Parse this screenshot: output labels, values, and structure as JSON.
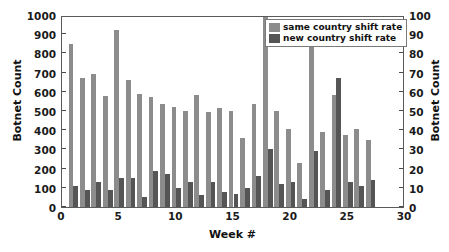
{
  "chart_data": {
    "type": "bar",
    "title": "",
    "xlabel": "Week #",
    "ylabel": "Botnet Count",
    "ylabel_right": "Botnet Count",
    "xlim": [
      0,
      30
    ],
    "ylim": [
      0,
      1000
    ],
    "ylim_right": [
      0,
      100
    ],
    "grid": false,
    "legend_position": "top-right",
    "x_ticks": [
      0,
      5,
      10,
      15,
      20,
      25,
      30
    ],
    "y_ticks_left": [
      0,
      100,
      200,
      300,
      400,
      500,
      600,
      700,
      800,
      900,
      1000
    ],
    "y_ticks_right": [
      0,
      10,
      20,
      30,
      40,
      50,
      60,
      70,
      80,
      90,
      100
    ],
    "categories": [
      1,
      2,
      3,
      4,
      5,
      6,
      7,
      8,
      9,
      10,
      11,
      12,
      13,
      14,
      15,
      16,
      17,
      18,
      19,
      20,
      21,
      22,
      23,
      24,
      25,
      26,
      27,
      28
    ],
    "series": [
      {
        "name": "same country shift rate",
        "axis": "left",
        "color": "#8c8c8c",
        "values": [
          848,
          673,
          692,
          577,
          922,
          660,
          590,
          575,
          535,
          520,
          500,
          586,
          494,
          514,
          500,
          362,
          536,
          1000,
          501,
          407,
          230,
          853,
          393,
          583,
          377,
          407,
          350,
          0
        ]
      },
      {
        "name": "new country shift rate",
        "axis": "right",
        "color": "#555555",
        "values": [
          11,
          9,
          13,
          9,
          15,
          15,
          5,
          19,
          17,
          10,
          13,
          6,
          13,
          8,
          7,
          10,
          16,
          30,
          12,
          13,
          4,
          29,
          9,
          67,
          13,
          11,
          14,
          0
        ]
      }
    ]
  },
  "axes": {
    "left_title": "Botnet Count",
    "right_title": "Botnet Count",
    "x_title": "Week #"
  },
  "legend": {
    "items": [
      {
        "label": "same country shift rate",
        "color": "#8c8c8c"
      },
      {
        "label": "new country shift rate",
        "color": "#555555"
      }
    ]
  }
}
